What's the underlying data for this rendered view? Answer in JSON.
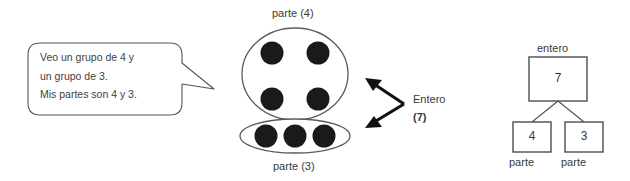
{
  "page": {
    "language": "es",
    "background_color": "#ffffff",
    "ink_color": "#3a3a3a",
    "dot_color": "#1a1a1a"
  },
  "speech_bubble": {
    "lines": [
      "Veo un grupo de 4 y",
      "un grupo de 3.",
      "Mis partes son 4 y 3."
    ]
  },
  "dot_diagram": {
    "top_group": {
      "label": "parte (4)",
      "count": 4
    },
    "bottom_group": {
      "label": "parte (3)",
      "count": 3
    },
    "arrow_label": {
      "text": "Entero",
      "value": "(7)"
    }
  },
  "number_bond": {
    "whole": {
      "label": "entero",
      "value": "7"
    },
    "parts": [
      {
        "label": "parte",
        "value": "4"
      },
      {
        "label": "parte",
        "value": "3"
      }
    ]
  }
}
